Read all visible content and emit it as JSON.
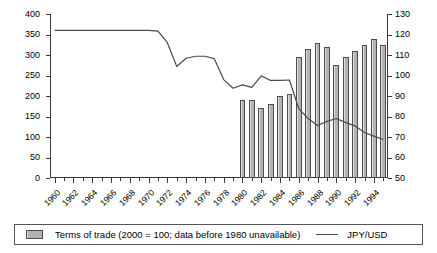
{
  "chart_data": {
    "type": "bar",
    "title": "",
    "xlabel": "",
    "ylabel": "",
    "grid": false,
    "legend_position": "bottom",
    "x": [
      1960,
      1961,
      1962,
      1963,
      1964,
      1965,
      1966,
      1967,
      1968,
      1969,
      1970,
      1971,
      1972,
      1973,
      1974,
      1975,
      1976,
      1977,
      1978,
      1979,
      1980,
      1981,
      1982,
      1983,
      1984,
      1985,
      1986,
      1987,
      1988,
      1989,
      1990,
      1991,
      1992,
      1993,
      1994,
      1995
    ],
    "xtick_labels": [
      "1960",
      "1962",
      "1964",
      "1966",
      "1968",
      "1970",
      "1972",
      "1974",
      "1976",
      "1978",
      "1980",
      "1982",
      "1984",
      "1986",
      "1988",
      "1990",
      "1992",
      "1994"
    ],
    "xtick_values": [
      1960,
      1962,
      1964,
      1966,
      1968,
      1970,
      1972,
      1974,
      1976,
      1978,
      1980,
      1982,
      1984,
      1986,
      1988,
      1990,
      1992,
      1994
    ],
    "xlim": [
      1959.5,
      1995.5
    ],
    "left_axis": {
      "label": "",
      "ylim": [
        0,
        400
      ],
      "ticks": [
        0,
        50,
        100,
        150,
        200,
        250,
        300,
        350,
        400
      ],
      "tick_labels": [
        "0",
        "50",
        "100",
        "150",
        "200",
        "250",
        "300",
        "350",
        "400"
      ]
    },
    "right_axis": {
      "label": "",
      "ylim": [
        50,
        130
      ],
      "ticks": [
        50,
        60,
        70,
        80,
        90,
        100,
        110,
        120,
        130
      ],
      "tick_labels": [
        "50",
        "60",
        "70",
        "80",
        "90",
        "100",
        "110",
        "120",
        "130"
      ]
    },
    "series": [
      {
        "name": "Terms of trade (2000 = 100; data before 1980 unavailable)",
        "type": "bar",
        "axis": "right",
        "color": "#b3b3b3",
        "edge_color": "#4d4d4d",
        "values": [
          null,
          null,
          null,
          null,
          null,
          null,
          null,
          null,
          null,
          null,
          null,
          null,
          null,
          null,
          null,
          null,
          null,
          null,
          null,
          null,
          88,
          88,
          84,
          86,
          90,
          91,
          109,
          113,
          116,
          114,
          105,
          109,
          112,
          115,
          118,
          115
        ]
      },
      {
        "name": "JPY/USD",
        "type": "line",
        "axis": "left",
        "color": "#4a4a4a",
        "values": [
          360,
          360,
          360,
          360,
          360,
          360,
          360,
          360,
          360,
          360,
          360,
          358,
          330,
          272,
          292,
          297,
          297,
          291,
          240,
          219,
          227,
          221,
          249,
          238,
          238,
          239,
          169,
          145,
          128,
          138,
          145,
          135,
          127,
          111,
          102,
          94
        ]
      }
    ]
  },
  "legend": {
    "bar_label": "Terms of trade (2000 = 100; data before 1980 unavailable)",
    "line_label": "JPY/USD"
  }
}
